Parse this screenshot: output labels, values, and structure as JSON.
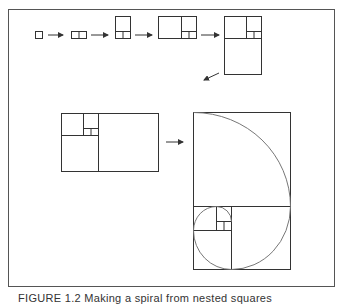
{
  "figure": {
    "caption": "FIGURE 1.2 Making a spiral from nested squares",
    "stroke_color": "#333333",
    "arc_color": "#777777",
    "steps": [
      {
        "name": "square-1x1"
      },
      {
        "name": "rect-2x1"
      },
      {
        "name": "rect-2x3"
      },
      {
        "name": "rect-5x3"
      },
      {
        "name": "rect-5x8"
      },
      {
        "name": "rect-13x8"
      },
      {
        "name": "golden-spiral"
      }
    ]
  }
}
